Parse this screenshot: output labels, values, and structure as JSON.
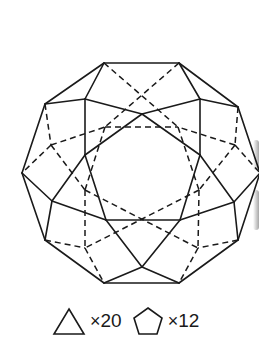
{
  "figure": {
    "line_color": "#1a1a1a",
    "background": "#ffffff"
  },
  "vertices_front": {
    "A": [
      104,
      63
    ],
    "B": [
      179,
      63
    ],
    "C": [
      45,
      104
    ],
    "D": [
      238,
      107
    ],
    "E": [
      85,
      99
    ],
    "F": [
      200,
      99
    ],
    "G": [
      142,
      114
    ],
    "H": [
      22,
      173
    ],
    "I": [
      260,
      173
    ],
    "J": [
      85,
      155
    ],
    "K": [
      200,
      155
    ],
    "L": [
      52,
      201
    ],
    "M": [
      234,
      202
    ],
    "N": [
      106,
      220
    ],
    "O": [
      180,
      220
    ],
    "P": [
      45,
      240
    ],
    "Q": [
      238,
      240
    ],
    "R": [
      142,
      267
    ],
    "S": [
      104,
      283
    ],
    "T": [
      179,
      283
    ]
  },
  "vertices_back": {
    "U": [
      141,
      81
    ],
    "V": [
      105,
      127
    ],
    "W": [
      178,
      127
    ],
    "X": [
      51,
      145
    ],
    "Y": [
      235,
      145
    ],
    "Z": [
      85,
      190
    ],
    "AA": [
      199,
      190
    ],
    "BB": [
      141,
      232
    ],
    "CC": [
      85,
      248
    ],
    "DD": [
      198,
      248
    ]
  },
  "legend": {
    "items": [
      {
        "shape": "triangle",
        "icon": "triangle-icon",
        "mult": "×",
        "count": "20"
      },
      {
        "shape": "pentagon",
        "icon": "pentagon-icon",
        "mult": "×",
        "count": "12"
      }
    ]
  }
}
